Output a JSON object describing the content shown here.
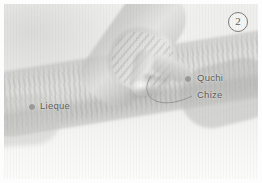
{
  "figure": {
    "number": "2",
    "caption_alt": "Acupressure demonstration on the forearm"
  },
  "acupoints": [
    {
      "id": "quchi",
      "label": "Quchi",
      "marker": "point-dot"
    },
    {
      "id": "chize",
      "label": "Chize",
      "marker": "leader-line"
    },
    {
      "id": "lieque",
      "label": "Lieque",
      "marker": "point-dot"
    }
  ],
  "icons": {
    "point_marker": "circle-dot-icon",
    "leader": "leader-line-icon",
    "figure_badge": "circled-number-icon"
  },
  "colors": {
    "label_text": "#5b5b59",
    "point_marker": "#9a9a98",
    "leader_line": "#8e8e8c",
    "plate_background": "#f3f3f2",
    "skin_midtone": "#d4d4d1"
  }
}
